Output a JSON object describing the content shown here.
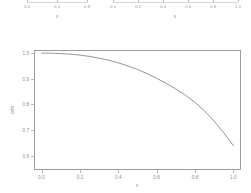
{
  "figure": {
    "background_color": "#ffffff",
    "foreground_color": "#8d8d8d",
    "frame_color": "#9d9d9d",
    "curve_color": "#8a8a8a"
  },
  "top_panel_left": {
    "axis_title": "x",
    "tick_labels": [
      "0.0",
      "0.4",
      "0.8"
    ],
    "tick_values": [
      0.0,
      0.4,
      0.8
    ]
  },
  "top_panel_right": {
    "axis_title": "x",
    "tick_labels": [
      "0.0",
      "0.2",
      "0.4",
      "0.6",
      "0.8",
      "1.0"
    ],
    "tick_values": [
      0.0,
      0.2,
      0.4,
      0.6,
      0.8,
      1.0
    ]
  },
  "chart_data": {
    "type": "line",
    "title": "",
    "subtitle": "",
    "xlabel": "x",
    "ylabel": "cdm",
    "xlim": [
      -0.04,
      1.04
    ],
    "ylim": [
      0.545,
      1.012
    ],
    "grid": false,
    "legend": false,
    "legend_position": "none",
    "x_tick_labels": [
      "0.0",
      "0.2",
      "0.4",
      "0.6",
      "0.8",
      "1.0"
    ],
    "x_tick_values": [
      0.0,
      0.2,
      0.4,
      0.6,
      0.8,
      1.0
    ],
    "y_tick_labels": [
      "0.6",
      "0.7",
      "0.8",
      "0.9",
      "1.0"
    ],
    "y_tick_values": [
      0.6,
      0.7,
      0.8,
      0.9,
      1.0
    ],
    "series": [
      {
        "name": "cdm",
        "x": [
          0.0,
          0.05,
          0.1,
          0.15,
          0.2,
          0.25,
          0.3,
          0.35,
          0.4,
          0.45,
          0.5,
          0.55,
          0.6,
          0.65,
          0.7,
          0.75,
          0.8,
          0.85,
          0.9,
          0.95,
          1.0
        ],
        "y": [
          1.0,
          0.9995,
          0.998,
          0.9955,
          0.992,
          0.987,
          0.98,
          0.972,
          0.962,
          0.95,
          0.936,
          0.92,
          0.902,
          0.882,
          0.86,
          0.836,
          0.808,
          0.775,
          0.735,
          0.69,
          0.64
        ]
      }
    ]
  }
}
